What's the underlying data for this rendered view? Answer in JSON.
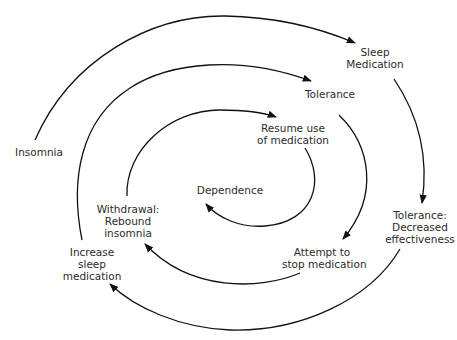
{
  "diagram": {
    "type": "spiral-cycle",
    "stroke_color": "#111111",
    "nodes": [
      {
        "id": "insomnia",
        "lines": [
          "Insomnia"
        ]
      },
      {
        "id": "sleep_medication",
        "lines": [
          "Sleep",
          "Medication"
        ]
      },
      {
        "id": "tolerance_decreased",
        "lines": [
          "Tolerance:",
          "Decreased",
          "effectiveness"
        ]
      },
      {
        "id": "increase_sleep_medication",
        "lines": [
          "Increase",
          "sleep",
          "medication"
        ]
      },
      {
        "id": "tolerance",
        "lines": [
          "Tolerance"
        ]
      },
      {
        "id": "attempt_stop",
        "lines": [
          "Attempt to",
          "stop medication"
        ]
      },
      {
        "id": "withdrawal",
        "lines": [
          "Withdrawal:",
          "Rebound",
          "insomnia"
        ]
      },
      {
        "id": "resume_use",
        "lines": [
          "Resume use",
          "of medication"
        ]
      },
      {
        "id": "dependence",
        "lines": [
          "Dependence"
        ]
      }
    ],
    "edges": [
      {
        "from": "insomnia",
        "to": "sleep_medication"
      },
      {
        "from": "sleep_medication",
        "to": "tolerance_decreased"
      },
      {
        "from": "tolerance_decreased",
        "to": "increase_sleep_medication"
      },
      {
        "from": "increase_sleep_medication",
        "to": "tolerance"
      },
      {
        "from": "tolerance",
        "to": "attempt_stop"
      },
      {
        "from": "attempt_stop",
        "to": "withdrawal"
      },
      {
        "from": "withdrawal",
        "to": "resume_use"
      },
      {
        "from": "resume_use",
        "to": "dependence"
      }
    ]
  }
}
